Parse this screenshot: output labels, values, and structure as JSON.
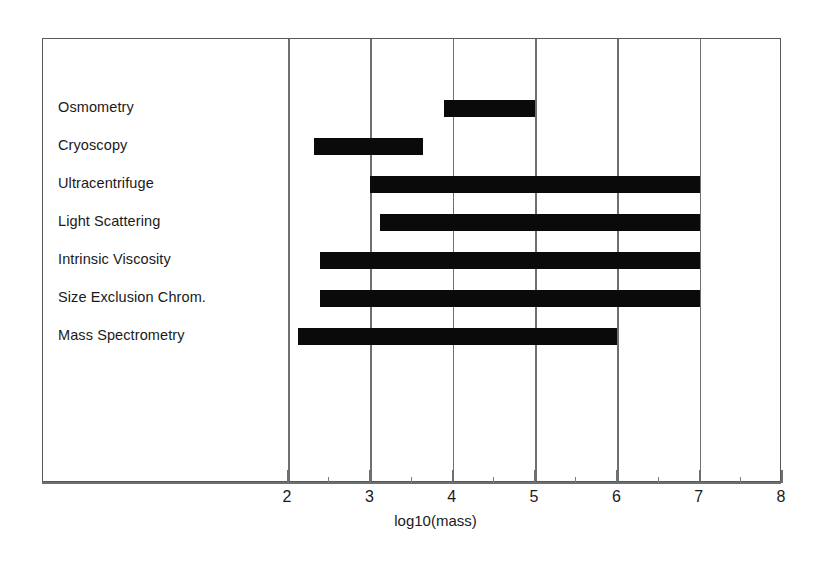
{
  "chart_data": {
    "type": "bar",
    "orientation": "horizontal",
    "subtype": "range-bar",
    "title": "",
    "xlabel": "log10(mass)",
    "ylabel": "",
    "xlim": [
      2,
      8
    ],
    "xticks": [
      2,
      3,
      4,
      5,
      6,
      7,
      8
    ],
    "xtick_labels": [
      "2",
      "3",
      "4",
      "5",
      "6",
      "7",
      "8"
    ],
    "minor_ticks": [
      2.5,
      3.5,
      4.5,
      5.5,
      6.5,
      7.5
    ],
    "grid": "vertical-major",
    "legend": "none",
    "bar_color": "#0a0a0a",
    "frame_color": "#58595b",
    "categories": [
      "Osmometry",
      "Cryoscopy",
      "Ultracentrifuge",
      "Light Scattering",
      "Intrinsic Viscosity",
      "Size Exclusion Chrom.",
      "Mass Spectrometry"
    ],
    "ranges": [
      {
        "label": "Osmometry",
        "start": 3.9,
        "end": 5.0
      },
      {
        "label": "Cryoscopy",
        "start": 2.31,
        "end": 3.64
      },
      {
        "label": "Ultracentrifuge",
        "start": 3.0,
        "end": 7.0
      },
      {
        "label": "Light Scattering",
        "start": 3.12,
        "end": 7.0
      },
      {
        "label": "Intrinsic Viscosity",
        "start": 2.39,
        "end": 7.0
      },
      {
        "label": "Size Exclusion Chrom.",
        "start": 2.39,
        "end": 7.0
      },
      {
        "label": "Mass Spectrometry",
        "start": 2.12,
        "end": 6.0
      }
    ]
  }
}
